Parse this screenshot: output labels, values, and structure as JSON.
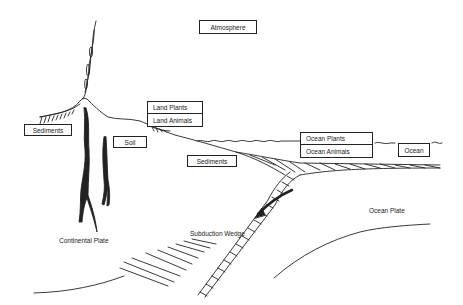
{
  "diagram": {
    "type": "carbon-cycle subduction schematic",
    "boxes": {
      "atmosphere": "Atmosphere",
      "sediments_left": "Sediments",
      "soil": "Soil",
      "land_plants": "Land Plants",
      "land_animals": "Land Animals",
      "sediments_middle": "Sediments",
      "ocean_plants": "Ocean Plants",
      "ocean_animals": "Ocean Animals",
      "ocean": "Ocean"
    },
    "labels": {
      "continental_plate": "Continental Plate",
      "subduction_wedge": "Subduction Wedge",
      "ocean_plate": "Ocean Plate"
    },
    "colors": {
      "line": "#222222",
      "background": "#ffffff"
    }
  }
}
